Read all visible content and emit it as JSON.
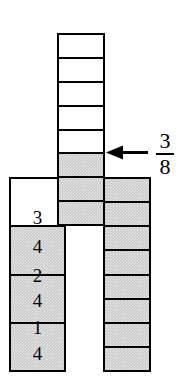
{
  "figure": {
    "colors": {
      "outline": "#000000",
      "shaded_fill": "#c9c9c9",
      "unshaded_fill": "#ffffff",
      "background": "#ffffff"
    }
  },
  "columns": {
    "middle": {
      "name": "eighths-column-center",
      "total_cells": 8,
      "shaded_cells": 3,
      "fraction": "3/8",
      "cells": [
        {
          "index": 1,
          "shaded": false
        },
        {
          "index": 2,
          "shaded": false
        },
        {
          "index": 3,
          "shaded": false
        },
        {
          "index": 4,
          "shaded": false
        },
        {
          "index": 5,
          "shaded": false
        },
        {
          "index": 6,
          "shaded": true
        },
        {
          "index": 7,
          "shaded": true
        },
        {
          "index": 8,
          "shaded": true
        }
      ]
    },
    "left": {
      "name": "fourths-column-left",
      "total_cells": 4,
      "shaded_cells": 3,
      "fraction": "3/4",
      "cells": [
        {
          "index": 1,
          "shaded": false
        },
        {
          "index": 2,
          "shaded": true
        },
        {
          "index": 3,
          "shaded": true
        },
        {
          "index": 4,
          "shaded": true
        }
      ]
    },
    "right": {
      "name": "eighths-column-right",
      "total_cells": 8,
      "shaded_cells": 8,
      "fraction": "8/8",
      "cells": [
        {
          "index": 1,
          "shaded": true
        },
        {
          "index": 2,
          "shaded": true
        },
        {
          "index": 3,
          "shaded": true
        },
        {
          "index": 4,
          "shaded": true
        },
        {
          "index": 5,
          "shaded": true
        },
        {
          "index": 6,
          "shaded": true
        },
        {
          "index": 7,
          "shaded": true
        },
        {
          "index": 8,
          "shaded": true
        }
      ]
    }
  },
  "labels": {
    "left_column_fractions": [
      {
        "numerator": "3",
        "denominator": "4"
      },
      {
        "numerator": "2",
        "denominator": "4"
      },
      {
        "numerator": "1",
        "denominator": "4"
      }
    ],
    "callout": {
      "numerator": "3",
      "denominator": "8",
      "points_to": "middle column shaded region",
      "arrow_direction": "left"
    }
  }
}
